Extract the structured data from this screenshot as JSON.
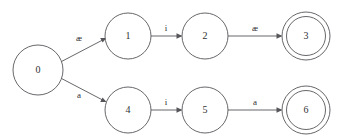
{
  "diagram": {
    "type": "finite-state-automaton",
    "title": "",
    "canvas": {
      "width": 342,
      "height": 136,
      "background": "#ffffff"
    },
    "style": {
      "stroke_color": "#56565a",
      "text_color": "#303034",
      "stroke_width": 0.9,
      "node_fill": "#ffffff"
    },
    "states": [
      {
        "id": "0",
        "label": "0",
        "cx": 38,
        "cy": 70,
        "r": 25,
        "accepting": false
      },
      {
        "id": "1",
        "label": "1",
        "cx": 128,
        "cy": 36,
        "r": 23,
        "accepting": false
      },
      {
        "id": "2",
        "label": "2",
        "cx": 205,
        "cy": 36,
        "r": 23,
        "accepting": false
      },
      {
        "id": "3",
        "label": "3",
        "cx": 306,
        "cy": 36,
        "r": 23,
        "accepting": true
      },
      {
        "id": "4",
        "label": "4",
        "cx": 128,
        "cy": 110,
        "r": 23,
        "accepting": false
      },
      {
        "id": "5",
        "label": "5",
        "cx": 205,
        "cy": 110,
        "r": 23,
        "accepting": false
      },
      {
        "id": "6",
        "label": "6",
        "cx": 306,
        "cy": 110,
        "r": 23,
        "accepting": true
      }
    ],
    "transitions": [
      {
        "from": "0",
        "to": "1",
        "label": "æ",
        "label_x": 79,
        "label_y": 41
      },
      {
        "from": "1",
        "to": "2",
        "label": "i",
        "label_x": 166,
        "label_y": 31
      },
      {
        "from": "2",
        "to": "3",
        "label": "æ",
        "label_x": 255,
        "label_y": 31
      },
      {
        "from": "0",
        "to": "4",
        "label": "a",
        "label_x": 79,
        "label_y": 98
      },
      {
        "from": "4",
        "to": "5",
        "label": "i",
        "label_x": 166,
        "label_y": 105
      },
      {
        "from": "5",
        "to": "6",
        "label": "a",
        "label_x": 255,
        "label_y": 105
      }
    ]
  }
}
